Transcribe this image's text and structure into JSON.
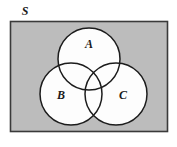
{
  "figure": {
    "type": "venn-diagram",
    "universal_set_label": "S",
    "sets": [
      {
        "id": "A",
        "label": "A",
        "position": "top",
        "cx": 89,
        "cy": 59,
        "r": 31,
        "label_x": 89,
        "label_y": 48
      },
      {
        "id": "B",
        "label": "B",
        "position": "bottom-left",
        "cx": 71,
        "cy": 94,
        "r": 31,
        "label_x": 61,
        "label_y": 99
      },
      {
        "id": "C",
        "label": "C",
        "position": "bottom-right",
        "cx": 116,
        "cy": 94,
        "r": 31,
        "label_x": 123,
        "label_y": 99
      }
    ],
    "universe": {
      "x": 10,
      "y": 21,
      "width": 158,
      "height": 111,
      "label_x": 25,
      "label_y": 15
    },
    "colors": {
      "universe_fill": "#bcbcbc",
      "universe_stroke": "#3a3a3a",
      "circle_fill": "#fdfdfd",
      "circle_stroke": "#1c1c1c",
      "label_color": "#1a1a1a",
      "page_background": "#ffffff"
    },
    "shading_note": "Region inside rectangle but outside all circles is shaded gray; all circle regions are unshaded (white)."
  }
}
